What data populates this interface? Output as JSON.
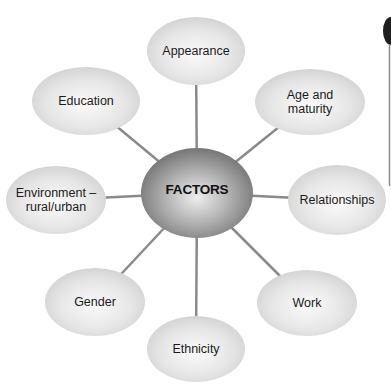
{
  "diagram": {
    "center": {
      "label": "FACTORS",
      "cx": 197,
      "cy": 193,
      "rx": 56,
      "ry": 45
    },
    "nodes": [
      {
        "id": "appearance",
        "label": "Appearance",
        "cx": 196,
        "cy": 51,
        "rx": 49,
        "ry": 34
      },
      {
        "id": "age-maturity",
        "label": "Age and\nmaturity",
        "cx": 310,
        "cy": 102,
        "rx": 55,
        "ry": 33
      },
      {
        "id": "relationships",
        "label": "Relationships",
        "cx": 337,
        "cy": 200,
        "rx": 49,
        "ry": 35
      },
      {
        "id": "work",
        "label": "Work",
        "cx": 307,
        "cy": 303,
        "rx": 50,
        "ry": 33
      },
      {
        "id": "ethnicity",
        "label": "Ethnicity",
        "cx": 196,
        "cy": 349,
        "rx": 49,
        "ry": 33
      },
      {
        "id": "gender",
        "label": "Gender",
        "cx": 95,
        "cy": 302,
        "rx": 50,
        "ry": 34
      },
      {
        "id": "environment",
        "label": "Environment –\nrural/urban",
        "cx": 56,
        "cy": 200,
        "rx": 50,
        "ry": 34
      },
      {
        "id": "education",
        "label": "Education",
        "cx": 86,
        "cy": 101,
        "rx": 54,
        "ry": 34
      }
    ],
    "colors": {
      "node_light": "#f4f4f4",
      "node_mid": "#dcdcdc",
      "node_edge": "#c8c8c8",
      "center_light": "#e0e0e0",
      "center_dark": "#6e6e6e",
      "connector": "#8a8a8a"
    }
  }
}
